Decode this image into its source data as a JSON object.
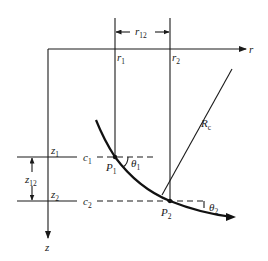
{
  "diagram": {
    "type": "geometry-figure",
    "axes": {
      "horizontal": {
        "label": "r"
      },
      "vertical": {
        "label": "z"
      }
    },
    "radial_positions": [
      {
        "label": "r",
        "sub": "1"
      },
      {
        "label": "r",
        "sub": "2"
      }
    ],
    "radial_spacing": {
      "label": "r",
      "sub": "12"
    },
    "depth_levels": [
      {
        "label": "z",
        "sub": "1",
        "level_label": "c",
        "level_sub": "1"
      },
      {
        "label": "z",
        "sub": "2",
        "level_label": "c",
        "level_sub": "2"
      }
    ],
    "depth_spacing": {
      "label": "z",
      "sub": "12"
    },
    "points": [
      {
        "label": "P",
        "sub": "1",
        "angle_label": "θ",
        "angle_sub": "1"
      },
      {
        "label": "P",
        "sub": "2",
        "angle_label": "θ",
        "angle_sub": "2"
      }
    ],
    "radius": {
      "label": "R",
      "sub": "c"
    },
    "colors": {
      "ink": "#1a1a1a",
      "background": "#ffffff"
    }
  }
}
